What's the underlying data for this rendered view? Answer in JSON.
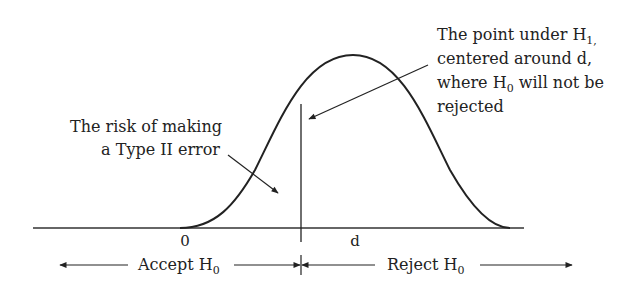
{
  "diagram": {
    "left_annotation": {
      "line1": "The risk of making",
      "line2": "a Type II error"
    },
    "right_annotation": {
      "line1_prefix": "The point under H",
      "line1_sub": "1,",
      "line2": "centered around d,",
      "line3_prefix": "where H",
      "line3_sub": "0",
      "line3_suffix": " will not be",
      "line4": "rejected"
    },
    "axis": {
      "zero_label": "0",
      "d_label": "d"
    },
    "regions": {
      "accept_prefix": "Accept H",
      "accept_sub": "0",
      "reject_prefix": "Reject H",
      "reject_sub": "0"
    },
    "colors": {
      "ink": "#222222",
      "background": "#ffffff"
    }
  }
}
